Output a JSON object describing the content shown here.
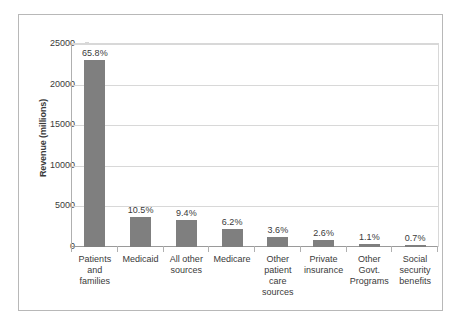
{
  "chart_data": {
    "type": "bar",
    "title": "",
    "xlabel": "",
    "ylabel": "Revenue (millions)",
    "ylim": [
      0,
      25000
    ],
    "ytick_labels": [
      "25000",
      "20000",
      "15000",
      "10000",
      "5000",
      "0"
    ],
    "ytick_values": [
      25000,
      20000,
      15000,
      10000,
      5000,
      0
    ],
    "grid": true,
    "legend": "none",
    "bar_color": "#7f7f7f",
    "categories": [
      "Patients and families",
      "Medicaid",
      "All other sources",
      "Medicare",
      "Other patient care sources",
      "Private insurance",
      "Other Govt. Programs",
      "Social security benefits"
    ],
    "category_lines": [
      [
        "Patients",
        "and",
        "families"
      ],
      [
        "Medicaid"
      ],
      [
        "All other",
        "sources"
      ],
      [
        "Medicare"
      ],
      [
        "Other",
        "patient",
        "care",
        "sources"
      ],
      [
        "Private",
        "insurance"
      ],
      [
        "Other",
        "Govt.",
        "Programs"
      ],
      [
        "Social",
        "security",
        "benefits"
      ]
    ],
    "values": [
      23030,
      3675,
      3290,
      2170,
      1260,
      910,
      385,
      245
    ],
    "data_labels": [
      "65.8%",
      "10.5%",
      "9.4%",
      "6.2%",
      "3.6%",
      "2.6%",
      "1.1%",
      "0.7%"
    ],
    "percentages": [
      65.8,
      10.5,
      9.4,
      6.2,
      3.6,
      2.6,
      1.1,
      0.7
    ]
  }
}
